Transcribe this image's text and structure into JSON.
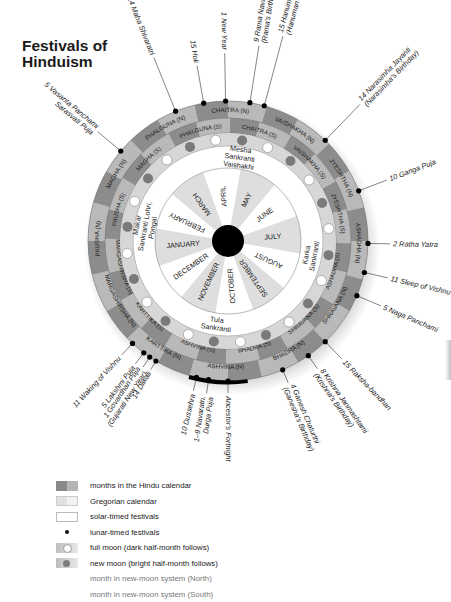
{
  "title": "Festivals of Hinduism",
  "title_lines": [
    "Festivals of",
    "Hinduism"
  ],
  "colors": {
    "ring_dark": "#8c8c8c",
    "ring_light": "#b9b9b9",
    "moon_ring": "#d7d7d7",
    "solar_ring": "#ffffff",
    "greg_shade": "#dedede",
    "greg_white": "#ffffff",
    "center": "#000000",
    "new_moon": "#7a7a7a",
    "full_moon": "#ffffff"
  },
  "hindu_months_north": [
    "CHAITRA (N)",
    "VAISHAKHA (N)",
    "JYESHTHA (N)",
    "ASHADHA (N)",
    "SHRAVANA (N)",
    "BHADRA (N)",
    "ASHVINA (N)",
    "KARTTIKA (N)",
    "MARGASHIRSHA (N)",
    "PAUSHA (N)",
    "MAGHA (N)",
    "PHALGUNA (N)"
  ],
  "hindu_months_south": [
    "CHAITRA (S)",
    "VAISHAKHA (S)",
    "JYESHTHA (S)",
    "ASHADHA (S)",
    "SHRAVANA (S)",
    "BHADRA (S)",
    "ASHVINA (S)",
    "KARTTIKA (S)",
    "MARGASHIRSHA (S)",
    "PAUSHA (S)",
    "MAGHA (S)",
    "PHALGUNA (S)"
  ],
  "gregorian_months": [
    "APRIL",
    "MAY",
    "JUNE",
    "JULY",
    "AUGUST",
    "SEPTEMBER",
    "OCTOBER",
    "NOVEMBER",
    "DECEMBER",
    "JANUARY",
    "FEBRUARY",
    "MARCH"
  ],
  "solar_festivals": [
    {
      "lines": [
        "Mesha",
        "Sankranti",
        "Vaishakhi"
      ],
      "angle": 8
    },
    {
      "lines": [
        "Karka",
        "Sankranti"
      ],
      "angle": 100
    },
    {
      "lines": [
        "Tula",
        "Sankranti"
      ],
      "angle": 188
    },
    {
      "lines": [
        "Makar",
        "Sankranti Lohri,",
        "Pongal"
      ],
      "angle": 280
    }
  ],
  "lunar_festivals": [
    {
      "label": "1 New Year",
      "angle": -1,
      "len": 48,
      "italic": false
    },
    {
      "label": "9 Rama Navami",
      "sub": "(Rama's Birthday)",
      "angle": 9,
      "len": 58
    },
    {
      "label": "15 Hanuman Jayanti",
      "sub": "(Hanuman's Birthday)",
      "angle": 15,
      "len": 72
    },
    {
      "label": "14 Narasimha Jayanti",
      "sub": "(Narasimha's Birthday)",
      "angle": 44,
      "len": 50
    },
    {
      "label": "10 Ganga Puja",
      "angle": 69,
      "len": 30
    },
    {
      "label": "2 Ratha Yatra",
      "angle": 91,
      "len": 22
    },
    {
      "label": "11 Sleep of Vishnu",
      "angle": 103,
      "len": 24
    },
    {
      "label": "5 Naga Panchami",
      "angle": 113,
      "len": 26
    },
    {
      "label": "15 Raksha-bandhan",
      "angle": 136,
      "len": 24
    },
    {
      "label": "8 Krishna Janmashtami",
      "sub": "(Krishna's Birthday)",
      "angle": 145,
      "len": 16
    },
    {
      "label": "4 Ganesh Chaturthi",
      "sub": "(Ganesha's Birthday)",
      "angle": 157,
      "len": 14
    },
    {
      "label": "Ancestor's Fortnight",
      "angle": 180,
      "len": 12
    },
    {
      "label": "1–9 Navaratri,",
      "sub": "Durga Puja",
      "angle": 188,
      "len": 14
    },
    {
      "label": "10 Dussehra",
      "angle": 193,
      "len": 14
    },
    {
      "label": "14 Diwali",
      "angle": 211,
      "len": 10
    },
    {
      "label": "1 Govardhan Puja",
      "sub": "(Gujarati New Year)",
      "angle": 214,
      "len": 12
    },
    {
      "label": "5 Lakshmi Puja",
      "angle": 217,
      "len": 14
    },
    {
      "label": "11 Waking of Vishnu",
      "angle": 223,
      "len": 16
    },
    {
      "label": "5 Vasanta Panchami",
      "sub": "Sarasvati Puja",
      "angle": 310,
      "len": 30
    },
    {
      "label": "14 Maha Shivaratri",
      "angle": 338,
      "len": 58
    },
    {
      "label": "15 Holi",
      "angle": 350,
      "len": 38
    }
  ],
  "legend": [
    {
      "swatch": "hindu",
      "label": "months in the Hindu calendar"
    },
    {
      "swatch": "greg",
      "label": "Gregorian calendar"
    },
    {
      "swatch": "solar",
      "label": "solar-timed festivals"
    },
    {
      "swatch": "lunar",
      "label": "lunar-timed festivals"
    },
    {
      "swatch": "full",
      "label": "full moon (dark half-month follows)"
    },
    {
      "swatch": "new",
      "label": "new moon (bright half-month follows)"
    },
    {
      "swatch": "none",
      "label": "month in new-moon system (North)",
      "gray": true
    },
    {
      "swatch": "none",
      "label": "month in new-moon system (South)",
      "gray": true
    }
  ]
}
